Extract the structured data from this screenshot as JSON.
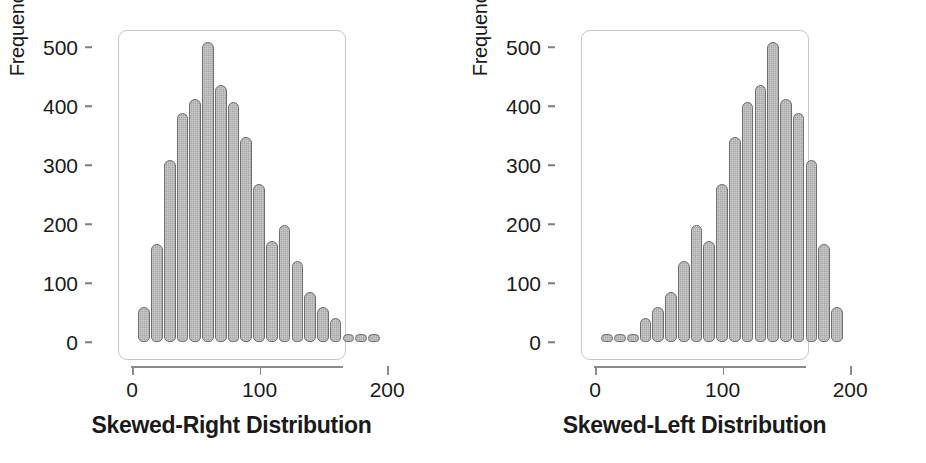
{
  "figure": {
    "panels": [
      {
        "id": "skewed-right",
        "caption": "Skewed-Right Distribution",
        "ylabel": "Frequency",
        "yticks": [
          "0",
          "100",
          "200",
          "300",
          "400",
          "500"
        ],
        "xticks": [
          "0",
          "100",
          "200"
        ]
      },
      {
        "id": "skewed-left",
        "caption": "Skewed-Left Distribution",
        "ylabel": "Frequency",
        "yticks": [
          "0",
          "100",
          "200",
          "300",
          "400",
          "500"
        ],
        "xticks": [
          "0",
          "100",
          "200"
        ]
      }
    ]
  },
  "chart_data": [
    {
      "type": "bar",
      "title": "Skewed-Right Distribution",
      "xlabel": "",
      "ylabel": "Frequency",
      "ylim": [
        0,
        530
      ],
      "xlim": [
        0,
        230
      ],
      "grid": false,
      "legend": null,
      "bin_width": 10,
      "bin_centers": [
        10,
        20,
        30,
        40,
        50,
        60,
        70,
        80,
        90,
        100,
        110,
        120,
        130,
        140,
        150,
        160,
        170,
        180,
        190,
        200,
        210,
        220
      ],
      "values": [
        59,
        166,
        308,
        389,
        412,
        509,
        436,
        406,
        348,
        267,
        172,
        198,
        138,
        84,
        59,
        40,
        12,
        10,
        10,
        0,
        0,
        0
      ],
      "note": "Unimodal histogram with long right tail; peak 509 near x=60"
    },
    {
      "type": "bar",
      "title": "Skewed-Left Distribution",
      "xlabel": "",
      "ylabel": "Frequency",
      "ylim": [
        0,
        530
      ],
      "xlim": [
        0,
        230
      ],
      "grid": false,
      "legend": null,
      "bin_width": 10,
      "bin_centers": [
        10,
        20,
        30,
        40,
        50,
        60,
        70,
        80,
        90,
        100,
        110,
        120,
        130,
        140,
        150,
        160,
        170,
        180,
        190,
        200,
        210,
        220
      ],
      "values": [
        10,
        10,
        12,
        40,
        59,
        84,
        138,
        198,
        172,
        267,
        348,
        406,
        436,
        509,
        412,
        389,
        308,
        166,
        59,
        0,
        0,
        0
      ],
      "note": "Mirror image of the skewed-right histogram; long left tail; peak 509 near x=160"
    }
  ],
  "style": {
    "bar_fill": "#a8a8a8",
    "bar_stroke": "#6e6e6e",
    "frame_stroke": "#c8c8c8",
    "axis_stroke": "#8a8a8a",
    "text_color": "#1a1a1a",
    "background": "#ffffff"
  }
}
